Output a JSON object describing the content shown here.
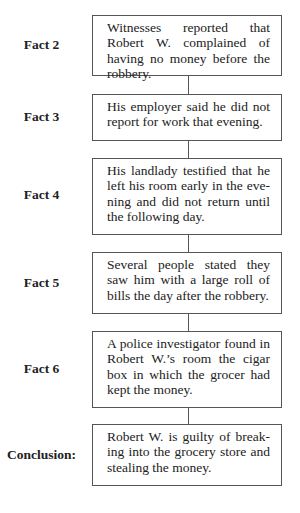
{
  "diagram": {
    "steps": [
      {
        "label": "Fact 2",
        "text": "Witnesses reported that Robert W. complained of having no money before the robbery."
      },
      {
        "label": "Fact 3",
        "text": "His employer said he did not report for work that evening."
      },
      {
        "label": "Fact 4",
        "text": "His landlady testified that he left his room early in the eve­ning and did not return until the following day."
      },
      {
        "label": "Fact 5",
        "text": "Several people stated they saw him with a large roll of bills the day after the robbery."
      },
      {
        "label": "Fact 6",
        "text": "A police investigator found in Robert W.’s room the cigar box in which the grocer had kept the money."
      },
      {
        "label": "Conclusion:",
        "text": "Robert W. is guilty of break­ing into the grocery store and stealing the money."
      }
    ]
  }
}
